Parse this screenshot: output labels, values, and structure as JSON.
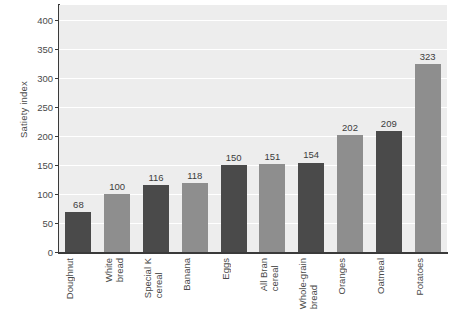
{
  "chart_data": {
    "type": "bar",
    "title": "",
    "xlabel": "",
    "ylabel": "Satiety index",
    "ylim": [
      0,
      425
    ],
    "grid": true,
    "legend": "none",
    "yticks": [
      0,
      50,
      100,
      150,
      200,
      250,
      300,
      350,
      400
    ],
    "ytick_labels": [
      "0",
      "50",
      "100",
      "150",
      "200",
      "250",
      "300",
      "350",
      "400"
    ],
    "categories": [
      "Doughnut",
      "White bread",
      "Special K cereal",
      "Banana",
      "Eggs",
      "All Bran cereal",
      "Whole-grain bread",
      "Oranges",
      "Oatmeal",
      "Potatoes"
    ],
    "category_lines": [
      [
        "Doughnut"
      ],
      [
        "White",
        "bread"
      ],
      [
        "Special K",
        "cereal"
      ],
      [
        "Banana"
      ],
      [
        "Eggs"
      ],
      [
        "All Bran",
        "cereal"
      ],
      [
        "Whole-grain",
        "bread"
      ],
      [
        "Oranges"
      ],
      [
        "Oatmeal"
      ],
      [
        "Potatoes"
      ]
    ],
    "values": [
      68,
      100,
      116,
      118,
      150,
      151,
      154,
      202,
      209,
      323
    ],
    "value_labels": [
      "68",
      "100",
      "116",
      "118",
      "150",
      "151",
      "154",
      "202",
      "209",
      "323"
    ],
    "bar_colors": [
      "#4a4a4a",
      "#8e8e8e",
      "#4a4a4a",
      "#8e8e8e",
      "#4a4a4a",
      "#8e8e8e",
      "#4a4a4a",
      "#8e8e8e",
      "#4a4a4a",
      "#8e8e8e"
    ],
    "plot_background": "#ededed",
    "gridline_color": "#ffffff",
    "axis_color": "#3a3a3a",
    "text_color": "#4a4a4a"
  }
}
